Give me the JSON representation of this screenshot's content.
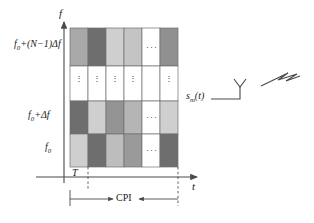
{
  "figure": {
    "type": "frequency-agile-waveform-time-frequency-grid",
    "axes": {
      "y_axis_label": "f",
      "x_axis_label": "t",
      "y_tick_labels": [
        {
          "base": "f",
          "sub": "0",
          "rest": "+(N−1)Δf",
          "row": 3
        },
        {
          "base": "f",
          "sub": "0",
          "rest": "+Δf",
          "row": 1
        },
        {
          "base": "f",
          "sub": "0",
          "rest": "",
          "row": 0
        }
      ]
    },
    "annotations": {
      "pulse_width_label": "T",
      "cpi_label": "CPI",
      "signal_label": {
        "base": "s",
        "sub": "m",
        "rest": "(t)"
      }
    },
    "grid": {
      "columns": 6,
      "rows": 4,
      "ellipsis_column_index": 4,
      "ellipsis_row_index": 2,
      "horizontal_ellipsis": "···",
      "vertical_ellipsis": "⋮",
      "cell_fills": [
        [
          "#a8a8a8",
          "#6e6e6e",
          "#cfcfcf",
          "#c4c4c4",
          "#ffffff",
          "#909090"
        ],
        [
          "#6e6e6e",
          "#cfcfcf",
          "#949494",
          "#b5b5b5",
          "#ffffff",
          "#cfcfcf"
        ],
        [
          "#ffffff",
          "#ffffff",
          "#ffffff",
          "#ffffff",
          "#ffffff",
          "#ffffff"
        ],
        [
          "#cfcfcf",
          "#6e6e6e",
          "#bdbdbd",
          "#9a9a9a",
          "#ffffff",
          "#6e6e6e"
        ]
      ]
    },
    "colors": {
      "stroke": "#4a4a4a",
      "cell_border": "#6f6f6f",
      "text": "#1a1a1a",
      "background": "#ffffff"
    },
    "icons": {
      "antenna": "antenna-icon",
      "radiation": "lightning-bolt-icon"
    }
  }
}
